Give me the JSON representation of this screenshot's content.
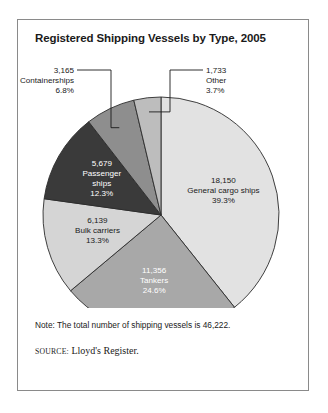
{
  "figure": {
    "title": "Registered Shipping Vessels by Type, 2005",
    "note": "Note: The total number of shipping vessels is 46,222.",
    "source_kicker": "SOURCE:",
    "source_text": "Lloyd's Register."
  },
  "chart_data": {
    "type": "pie",
    "title": "Registered Shipping Vessels by Type, 2005",
    "total": 46222,
    "total_label": "46,222",
    "unit": "vessels",
    "legend": "none",
    "start_angle_deg": 0,
    "direction": "clockwise",
    "categories": [
      "General cargo ships",
      "Tankers",
      "Bulk carriers",
      "Passenger ships",
      "Containerships",
      "Other"
    ],
    "values": [
      18150,
      11356,
      6139,
      5679,
      3165,
      1733
    ],
    "percents": [
      39.3,
      24.6,
      13.3,
      12.3,
      6.8,
      3.7
    ],
    "slices": [
      {
        "name": "General cargo ships",
        "value": 18150,
        "value_label": "18,150",
        "percent": 39.3,
        "percent_label": "39.3%",
        "color": "#e2e2e2",
        "label_placement": "inside",
        "label_color": "dark"
      },
      {
        "name": "Tankers",
        "value": 11356,
        "value_label": "11,356",
        "percent": 24.6,
        "percent_label": "24.6%",
        "color": "#a8a8a8",
        "label_placement": "inside",
        "label_color": "light"
      },
      {
        "name": "Bulk carriers",
        "value": 6139,
        "value_label": "6,139",
        "percent": 13.3,
        "percent_label": "13.3%",
        "color": "#d5d5d5",
        "label_placement": "inside",
        "label_color": "dark"
      },
      {
        "name": "Passenger ships",
        "value": 5679,
        "value_label": "5,679",
        "percent": 12.3,
        "percent_label": "12.3%",
        "color": "#3a3a3a",
        "label_placement": "inside",
        "label_color": "light"
      },
      {
        "name": "Containerships",
        "value": 3165,
        "value_label": "3,165",
        "percent": 6.8,
        "percent_label": "6.8%",
        "color": "#8e8e8e",
        "label_placement": "callout-left",
        "label_color": "dark"
      },
      {
        "name": "Other",
        "value": 1733,
        "value_label": "1,733",
        "percent": 3.7,
        "percent_label": "3.7%",
        "color": "#bdbdbd",
        "label_placement": "callout-right",
        "label_color": "dark"
      }
    ]
  }
}
